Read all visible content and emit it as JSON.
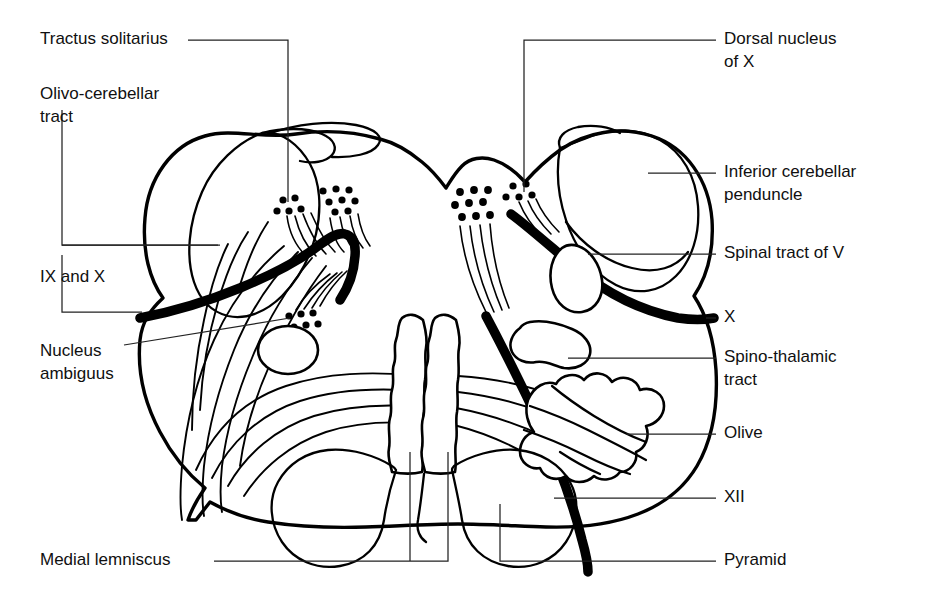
{
  "figure": {
    "background_color": "#ffffff",
    "ink_color": "#000000",
    "leader_color": "#222222",
    "width": 933,
    "height": 598
  },
  "labels": {
    "left": [
      {
        "id": "tractus-solitarius",
        "text": "Tractus solitarius",
        "lines": [
          "Tractus solitarius"
        ],
        "x": 40,
        "y": 40,
        "side": "left"
      },
      {
        "id": "olivo-cerebellar-tract",
        "text": "Olivo-cerebellar tract",
        "lines": [
          "Olivo-cerebellar",
          "tract"
        ],
        "x": 40,
        "y": 95,
        "side": "left"
      },
      {
        "id": "ix-and-x",
        "text": "IX and X",
        "lines": [
          "IX and X"
        ],
        "x": 40,
        "y": 278,
        "side": "left"
      },
      {
        "id": "nucleus-ambiguus",
        "text": "Nucleus ambiguus",
        "lines": [
          "Nucleus",
          "ambiguus"
        ],
        "x": 40,
        "y": 352,
        "side": "left"
      },
      {
        "id": "medial-lemniscus",
        "text": "Medial lemniscus",
        "lines": [
          "Medial lemniscus"
        ],
        "x": 40,
        "y": 561,
        "side": "left"
      }
    ],
    "right": [
      {
        "id": "dorsal-nucleus-of-x",
        "text": "Dorsal nucleus of X",
        "lines": [
          "Dorsal nucleus",
          "of X"
        ],
        "x": 724,
        "y": 40,
        "side": "right"
      },
      {
        "id": "inferior-cerebellar-penduncle",
        "text": "Inferior cerebellar penduncle",
        "lines": [
          "Inferior cerebellar",
          "penduncle"
        ],
        "x": 724,
        "y": 173,
        "side": "right"
      },
      {
        "id": "spinal-tract-of-v",
        "text": "Spinal tract of V",
        "lines": [
          "Spinal tract of V"
        ],
        "x": 724,
        "y": 254,
        "side": "right"
      },
      {
        "id": "x",
        "text": "X",
        "lines": [
          "X"
        ],
        "x": 724,
        "y": 318,
        "side": "right"
      },
      {
        "id": "spino-thalamic-tract",
        "text": "Spino-thalamic tract",
        "lines": [
          "Spino-thalamic",
          "tract"
        ],
        "x": 724,
        "y": 358,
        "side": "right"
      },
      {
        "id": "olive",
        "text": "Olive",
        "lines": [
          "Olive"
        ],
        "x": 724,
        "y": 434,
        "side": "right"
      },
      {
        "id": "xii",
        "text": "XII",
        "lines": [
          "XII"
        ],
        "x": 724,
        "y": 498,
        "side": "right"
      },
      {
        "id": "pyramid",
        "text": "Pyramid",
        "lines": [
          "Pyramid"
        ],
        "x": 724,
        "y": 561,
        "side": "right"
      }
    ]
  },
  "structures": [
    {
      "id": "medulla-outline",
      "name": "Medulla oblongata outline"
    },
    {
      "id": "inferior-cerebellar-peduncle-left",
      "name": "Inferior cerebellar peduncle (left)"
    },
    {
      "id": "inferior-cerebellar-peduncle-right",
      "name": "Inferior cerebellar peduncle (right)"
    },
    {
      "id": "olive-hatched",
      "name": "Olive (hatched nucleus)"
    },
    {
      "id": "medial-lemniscus-columns",
      "name": "Medial lemniscus (stippled columns)"
    },
    {
      "id": "pyramid-left",
      "name": "Pyramid (left)"
    },
    {
      "id": "pyramid-right",
      "name": "Pyramid (right)"
    },
    {
      "id": "spino-thalamic-blob",
      "name": "Spino-thalamic tract"
    },
    {
      "id": "spinal-tract-of-v-oval",
      "name": "Spinal tract of V"
    },
    {
      "id": "nucleus-ambiguus-dots",
      "name": "Nucleus ambiguus dot cluster"
    },
    {
      "id": "dorsal-nucleus-dots",
      "name": "Dorsal nucleus of X dot cluster"
    },
    {
      "id": "tractus-solitarius-dots",
      "name": "Tractus solitarius dot cluster"
    },
    {
      "id": "vagus-tract-bold",
      "name": "Vagus (X) bold tract"
    },
    {
      "id": "pyramid-tract-bold",
      "name": "Pyramidal bold tract"
    }
  ]
}
